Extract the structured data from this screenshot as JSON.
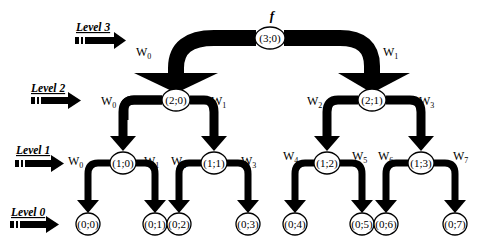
{
  "diagram": {
    "root_label": "f",
    "levels": [
      {
        "label": "Level 3",
        "y": 40
      },
      {
        "label": "Level 2",
        "y": 100
      },
      {
        "label": "Level 1",
        "y": 163
      },
      {
        "label": "Level 0",
        "y": 224
      }
    ],
    "nodes": [
      {
        "id": "3-0",
        "label": "(3;0)",
        "x": 270,
        "y": 38
      },
      {
        "id": "2-0",
        "label": "(2;0)",
        "x": 176,
        "y": 100
      },
      {
        "id": "2-1",
        "label": "(2;1)",
        "x": 372,
        "y": 100
      },
      {
        "id": "1-0",
        "label": "(1;0)",
        "x": 88,
        "y": 163
      },
      {
        "id": "1-1",
        "label": "(1;1)",
        "x": 214,
        "y": 163
      },
      {
        "id": "1-2",
        "label": "(1;2)",
        "x": 327,
        "y": 163
      },
      {
        "id": "1-3",
        "label": "(1;3)",
        "x": 421,
        "y": 163
      },
      {
        "id": "0-0",
        "label": "(0;0)",
        "x": 88,
        "y": 224
      },
      {
        "id": "0-1",
        "label": "(0;1)",
        "x": 155,
        "y": 224
      },
      {
        "id": "0-2",
        "label": "(0;2)",
        "x": 179,
        "y": 224
      },
      {
        "id": "0-3",
        "label": "(0;3)",
        "x": 248,
        "y": 224
      },
      {
        "id": "0-4",
        "label": "(0;4)",
        "x": 295,
        "y": 224
      },
      {
        "id": "0-5",
        "label": "(0;5)",
        "x": 362,
        "y": 224
      },
      {
        "id": "0-6",
        "label": "(0;6)",
        "x": 386,
        "y": 224
      },
      {
        "id": "0-7",
        "label": "(0;7)",
        "x": 455,
        "y": 224
      }
    ],
    "weights": [
      {
        "base": "W",
        "sub": "0",
        "x": 136,
        "y": 56
      },
      {
        "base": "W",
        "sub": "1",
        "x": 383,
        "y": 56
      },
      {
        "base": "W",
        "sub": "0",
        "x": 101,
        "y": 105
      },
      {
        "base": "W",
        "sub": "1",
        "x": 211,
        "y": 105
      },
      {
        "base": "W",
        "sub": "2",
        "x": 307,
        "y": 105
      },
      {
        "base": "W",
        "sub": "3",
        "x": 419,
        "y": 105
      },
      {
        "base": "W",
        "sub": "0",
        "x": 68,
        "y": 165
      },
      {
        "base": "W",
        "sub": "1",
        "x": 144,
        "y": 165
      },
      {
        "base": "W",
        "sub": "2",
        "x": 171,
        "y": 165
      },
      {
        "base": "W",
        "sub": "3",
        "x": 241,
        "y": 165
      },
      {
        "base": "W",
        "sub": "4",
        "x": 283,
        "y": 160
      },
      {
        "base": "W",
        "sub": "5",
        "x": 352,
        "y": 160
      },
      {
        "base": "W",
        "sub": "6",
        "x": 378,
        "y": 160
      },
      {
        "base": "W",
        "sub": "7",
        "x": 453,
        "y": 160
      }
    ]
  }
}
